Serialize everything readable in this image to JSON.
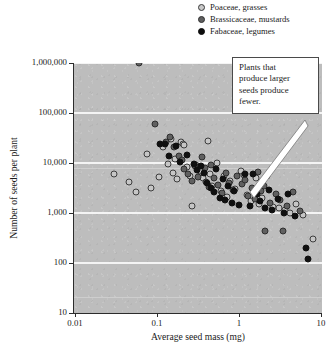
{
  "chart_data": {
    "type": "scatter",
    "title": "",
    "xlabel": "Average seed mass (mg)",
    "ylabel": "Number of seeds per plant",
    "xscale": "log",
    "yscale": "log",
    "xlim": [
      0.01,
      20
    ],
    "ylim": [
      10,
      1000000
    ],
    "grid": true,
    "xticks": [
      "0.01",
      "0.1",
      "1",
      "10"
    ],
    "xtick_values": [
      0.01,
      0.1,
      1,
      10
    ],
    "yticks": [
      "10",
      "100",
      "1,000",
      "10,000",
      "100,000",
      "1,000,000"
    ],
    "ytick_values": [
      10,
      100,
      1000,
      10000,
      100000,
      1000000
    ],
    "legend_position": "top-right",
    "series": [
      {
        "name": "Poaceae, grasses",
        "color": "#c6c6c6",
        "edge_color": "#3d3d3d",
        "points": [
          [
            0.03,
            6000
          ],
          [
            0.045,
            4200
          ],
          [
            0.055,
            2600
          ],
          [
            0.075,
            15000
          ],
          [
            0.085,
            3200
          ],
          [
            0.105,
            5200
          ],
          [
            0.12,
            21000
          ],
          [
            0.135,
            9500
          ],
          [
            0.15,
            30000
          ],
          [
            0.155,
            6400
          ],
          [
            0.165,
            12000
          ],
          [
            0.175,
            4800
          ],
          [
            0.195,
            26000
          ],
          [
            0.205,
            24000
          ],
          [
            0.215,
            23000
          ],
          [
            0.23,
            8200
          ],
          [
            0.25,
            5600
          ],
          [
            0.265,
            1400
          ],
          [
            0.3,
            9000
          ],
          [
            0.33,
            7000
          ],
          [
            0.36,
            5000
          ],
          [
            0.42,
            28000
          ],
          [
            0.44,
            6000
          ],
          [
            0.47,
            3400
          ],
          [
            0.54,
            9800
          ],
          [
            0.6,
            2800
          ],
          [
            0.66,
            5400
          ],
          [
            0.72,
            2100
          ],
          [
            0.78,
            4400
          ],
          [
            0.9,
            3000
          ],
          [
            1.05,
            6800
          ],
          [
            1.15,
            5800
          ],
          [
            1.25,
            2300
          ],
          [
            1.4,
            1700
          ],
          [
            1.6,
            4900
          ],
          [
            1.75,
            1500
          ],
          [
            1.9,
            2000
          ],
          [
            2.2,
            5600
          ],
          [
            2.6,
            1300
          ],
          [
            3.1,
            1250
          ],
          [
            3.6,
            1150
          ],
          [
            4.2,
            1000
          ],
          [
            5.0,
            1500
          ],
          [
            6.0,
            920
          ],
          [
            8.0,
            300
          ],
          [
            12.0,
            200
          ]
        ]
      },
      {
        "name": "Brassicaceae, mustards",
        "color": "#606060",
        "edge_color": "#2e2e2e",
        "points": [
          [
            0.06,
            1000000
          ],
          [
            0.095,
            60000
          ],
          [
            0.13,
            26000
          ],
          [
            0.145,
            33000
          ],
          [
            0.16,
            21000
          ],
          [
            0.185,
            14000
          ],
          [
            0.2,
            11500
          ],
          [
            0.215,
            7500
          ],
          [
            0.24,
            6000
          ],
          [
            0.27,
            4400
          ],
          [
            0.29,
            8800
          ],
          [
            0.32,
            5200
          ],
          [
            0.35,
            13000
          ],
          [
            0.38,
            7800
          ],
          [
            0.4,
            4200
          ],
          [
            0.43,
            3300
          ],
          [
            0.46,
            9200
          ],
          [
            0.5,
            5000
          ],
          [
            0.56,
            3600
          ],
          [
            0.62,
            2500
          ],
          [
            0.7,
            6200
          ],
          [
            0.76,
            4000
          ],
          [
            0.85,
            2900
          ],
          [
            0.95,
            5400
          ],
          [
            1.1,
            3800
          ],
          [
            1.2,
            4600
          ],
          [
            1.3,
            2200
          ],
          [
            1.45,
            3100
          ],
          [
            1.55,
            1900
          ],
          [
            1.7,
            6600
          ],
          [
            1.85,
            2700
          ],
          [
            2.0,
            3500
          ],
          [
            2.4,
            1600
          ],
          [
            2.8,
            2400
          ],
          [
            3.2,
            1800
          ],
          [
            3.8,
            1350
          ],
          [
            4.5,
            2600
          ],
          [
            5.5,
            1100
          ],
          [
            2.1,
            430
          ],
          [
            3.4,
            430
          ]
        ]
      },
      {
        "name": "Fabaceae, legumes",
        "color": "#101010",
        "edge_color": "#101010",
        "points": [
          [
            0.11,
            24000
          ],
          [
            0.125,
            23500
          ],
          [
            0.14,
            13500
          ],
          [
            0.17,
            22000
          ],
          [
            0.19,
            10500
          ],
          [
            0.235,
            14500
          ],
          [
            0.28,
            9400
          ],
          [
            0.31,
            7200
          ],
          [
            0.34,
            8600
          ],
          [
            0.37,
            6400
          ],
          [
            0.41,
            3900
          ],
          [
            0.45,
            3200
          ],
          [
            0.49,
            2600
          ],
          [
            0.52,
            7600
          ],
          [
            0.58,
            2000
          ],
          [
            0.64,
            4700
          ],
          [
            0.68,
            1800
          ],
          [
            0.74,
            3400
          ],
          [
            0.82,
            1550
          ],
          [
            0.88,
            2750
          ],
          [
            1.0,
            1450
          ],
          [
            1.18,
            5900
          ],
          [
            1.35,
            1350
          ],
          [
            1.5,
            6100
          ],
          [
            1.65,
            2350
          ],
          [
            1.8,
            1700
          ],
          [
            2.05,
            1250
          ],
          [
            2.3,
            2850
          ],
          [
            2.5,
            1150
          ],
          [
            3.0,
            1900
          ],
          [
            3.5,
            1000
          ],
          [
            4.0,
            2450
          ],
          [
            4.8,
            870
          ],
          [
            6.5,
            200
          ],
          [
            7.0,
            120
          ],
          [
            14.0,
            185
          ]
        ]
      }
    ],
    "annotation": {
      "text": "Plants that produce larger seeds produce fewer.",
      "lines": [
        "Plants that",
        "produce larger",
        "seeds produce",
        "fewer."
      ],
      "target_x": 7.0,
      "target_y": 1450
    }
  },
  "legend": {
    "items": [
      {
        "label": "Poaceae, grasses",
        "marker": "circle-light-gray"
      },
      {
        "label": "Brassicaceae, mustards",
        "marker": "circle-medium-gray"
      },
      {
        "label": "Fabaceae, legumes",
        "marker": "circle-black"
      }
    ]
  },
  "colors": {
    "plot_background": "#bdbdbd",
    "gridline": "#f4f4f4",
    "axis": "#2c2c2c",
    "callout_background": "#ffffff",
    "callout_border": "#4a4a4a"
  }
}
